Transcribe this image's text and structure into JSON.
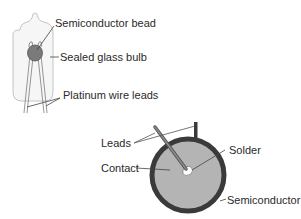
{
  "diagram": {
    "thermistor_bead": {
      "labels": {
        "bead": "Semiconductor bead",
        "bulb": "Sealed glass bulb",
        "leads": "Platinum wire leads"
      }
    },
    "thermistor_disc": {
      "labels": {
        "leads": "Leads",
        "contact": "Contact",
        "solder": "Solder",
        "semiconductor": "Semiconductor"
      }
    },
    "colors": {
      "bead_fill": "#7a7a7a",
      "disc_fill": "#b4b4b4",
      "disc_ring": "#3a3a3a",
      "line": "#444444",
      "text": "#2a2a2a"
    }
  }
}
